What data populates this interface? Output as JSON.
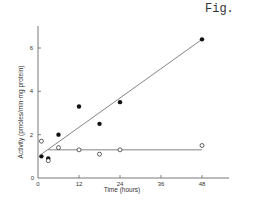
{
  "figure_label": "Fig.",
  "chart_data": {
    "type": "scatter",
    "title": "",
    "xlabel": "Time (hours)",
    "ylabel": "Activity (pmoles/min·mg protein)",
    "xlim": [
      0,
      56
    ],
    "ylim": [
      0,
      7
    ],
    "xticks": [
      0,
      12,
      24,
      36,
      48
    ],
    "xtick_labels": [
      "0",
      "12",
      "24",
      "36",
      "48"
    ],
    "yticks": [
      0,
      2,
      4,
      6
    ],
    "ytick_labels": [
      "0",
      "2",
      "4",
      "6"
    ],
    "grid": false,
    "legend": null,
    "series": [
      {
        "name": "filled circles",
        "marker": "filled-circle",
        "x": [
          1,
          3,
          6,
          12,
          18,
          24,
          48
        ],
        "y": [
          1.0,
          0.9,
          2.0,
          3.3,
          2.5,
          3.5,
          6.4
        ],
        "fit_line": {
          "x": [
            1,
            48
          ],
          "y": [
            1.1,
            6.4
          ]
        }
      },
      {
        "name": "open circles",
        "marker": "open-circle",
        "x": [
          1,
          3,
          6,
          12,
          18,
          24,
          48
        ],
        "y": [
          1.7,
          0.8,
          1.4,
          1.3,
          1.1,
          1.3,
          1.5
        ],
        "fit_line": {
          "x": [
            3,
            48
          ],
          "y": [
            1.3,
            1.3
          ]
        }
      }
    ]
  }
}
